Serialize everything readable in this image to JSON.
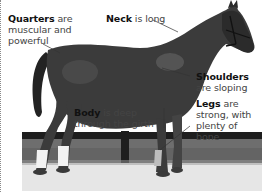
{
  "figure": {
    "labels": [
      {
        "id": "quarters",
        "term": "Quarters",
        "line1_rest": " are",
        "line2": "muscular and",
        "line3": "powerful"
      },
      {
        "id": "neck",
        "term": "Neck",
        "line1_rest": " is long"
      },
      {
        "id": "shoulders",
        "term": "Shoulders",
        "line2": "are sloping"
      },
      {
        "id": "body",
        "term": "Body",
        "line1_rest": " is deep",
        "line2": "through the girth"
      },
      {
        "id": "legs",
        "term": "Legs",
        "line1_rest": " are",
        "line2": "strong, with",
        "line3": "plenty of bone"
      }
    ]
  },
  "colors": {
    "background": "#ffffff",
    "horse": "#3a3a3a",
    "ground": "#e4e4e4",
    "grass": "#6f6f6f",
    "fence": "#1e1e1e",
    "bandage": "#f2f2f2",
    "text": "#444444",
    "term": "#111111"
  }
}
